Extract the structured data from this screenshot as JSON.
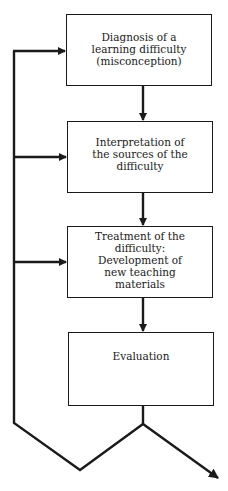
{
  "diagram": {
    "type": "flowchart",
    "steps": [
      {
        "id": "diagnosis",
        "label": "Diagnosis of a\nlearning difficulty\n(misconception)"
      },
      {
        "id": "interpretation",
        "label": "Interpretation of\nthe sources of the\ndifficulty"
      },
      {
        "id": "treatment",
        "label": "Treatment of the\ndifficulty:\nDevelopment of\nnew teaching\nmaterials"
      },
      {
        "id": "evaluation",
        "label": "Evaluation"
      }
    ],
    "edges": [
      {
        "from": "diagnosis",
        "to": "interpretation"
      },
      {
        "from": "interpretation",
        "to": "treatment"
      },
      {
        "from": "treatment",
        "to": "evaluation"
      },
      {
        "from": "evaluation",
        "to": "feedback-loop",
        "note": "feeds back to diagnosis, interpretation and treatment"
      },
      {
        "from": "evaluation",
        "to": "exit",
        "note": "arrow exits to bottom right"
      }
    ],
    "colors": {
      "line": "#1a1a1a",
      "background": "#ffffff"
    }
  }
}
